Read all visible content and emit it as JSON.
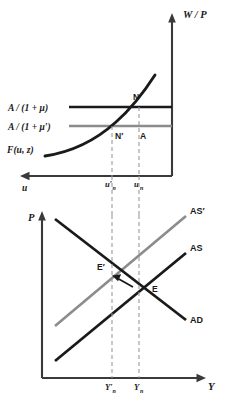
{
  "figure": {
    "title": "",
    "panels": [
      {
        "id": "labor-market",
        "yaxis_label": "W / P",
        "xaxis_label": "u",
        "curves": [
          {
            "name": "price-setting-original",
            "label": "A / (1 + μ)",
            "color": "#1a1a1a",
            "type": "horizontal"
          },
          {
            "name": "price-setting-new",
            "label": "A / (1 + μ′)",
            "color": "#8c8c8c",
            "type": "horizontal"
          },
          {
            "name": "wage-setting",
            "label": "F(u, z)",
            "color": "#1a1a1a",
            "type": "curve"
          }
        ],
        "points": [
          {
            "name": "N",
            "label": "N"
          },
          {
            "name": "N-prime",
            "label": "N′"
          },
          {
            "name": "A",
            "label": "A"
          }
        ],
        "ticks": [
          {
            "name": "u-prime-n",
            "label": "u′",
            "sub": "n"
          },
          {
            "name": "u-n",
            "label": "u",
            "sub": "n"
          }
        ]
      },
      {
        "id": "as-ad",
        "yaxis_label": "P",
        "xaxis_label": "Y",
        "curves": [
          {
            "name": "aggregate-supply-new",
            "label": "AS′",
            "color": "#8c8c8c"
          },
          {
            "name": "aggregate-supply",
            "label": "AS",
            "color": "#1a1a1a"
          },
          {
            "name": "aggregate-demand",
            "label": "AD",
            "color": "#1a1a1a"
          }
        ],
        "points": [
          {
            "name": "E-prime",
            "label": "E′"
          },
          {
            "name": "E",
            "label": "E"
          }
        ],
        "ticks": [
          {
            "name": "Y-prime-n",
            "label": "Y′",
            "sub": "n"
          },
          {
            "name": "Y-n",
            "label": "Y",
            "sub": "n"
          }
        ],
        "annotation": {
          "name": "adjustment-arrow",
          "label": ""
        }
      }
    ],
    "colors": {
      "ink": "#1a1a1a",
      "gray": "#8c8c8c",
      "dashed": "#9a9a9a",
      "axis": "#3a3a3a",
      "background": "#ffffff"
    }
  }
}
